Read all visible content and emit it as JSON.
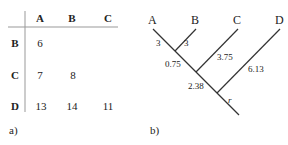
{
  "panel_a": {
    "caption": "a)",
    "col_headers": [
      "A",
      "B",
      "C"
    ],
    "row_headers": [
      "B",
      "C",
      "D"
    ],
    "rows": [
      [
        "6",
        "",
        ""
      ],
      [
        "7",
        "8",
        ""
      ],
      [
        "13",
        "14",
        "11"
      ]
    ]
  },
  "panel_b": {
    "caption": "b)",
    "leaves": [
      "A",
      "B",
      "C",
      "D"
    ],
    "branch_lengths": {
      "A": "3",
      "B": "3",
      "AB_to_ABC": "0.75",
      "C": "3.75",
      "ABC_to_root": "2.38",
      "D": "6.13"
    },
    "root_label": "r"
  }
}
